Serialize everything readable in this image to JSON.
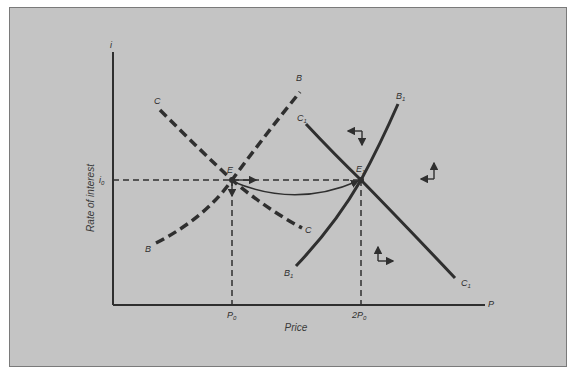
{
  "diagram": {
    "axes": {
      "y_label": "i",
      "y_title": "Rate of interest",
      "x_label": "P",
      "x_title": "Price",
      "i0_label": "i",
      "i0_sub": "0",
      "p0_label": "P",
      "p0_sub": "0",
      "p2_label": "2P",
      "p2_sub": "0"
    },
    "points": {
      "E": "E",
      "E1": "E",
      "E1_sub": "1"
    },
    "curves": {
      "C_top": "C",
      "C_bottom": "C",
      "B_top": "B",
      "B_bottom": "B",
      "C1_top": "C",
      "C1_top_sub": "1",
      "C1_bottom": "C",
      "C1_bottom_sub": "1",
      "B1_top": "B",
      "B1_top_sub": "1",
      "B1_bottom": "B",
      "B1_bottom_sub": "1"
    },
    "colors": {
      "background": "#c4c4c4",
      "ink": "#2f2f2f"
    }
  }
}
